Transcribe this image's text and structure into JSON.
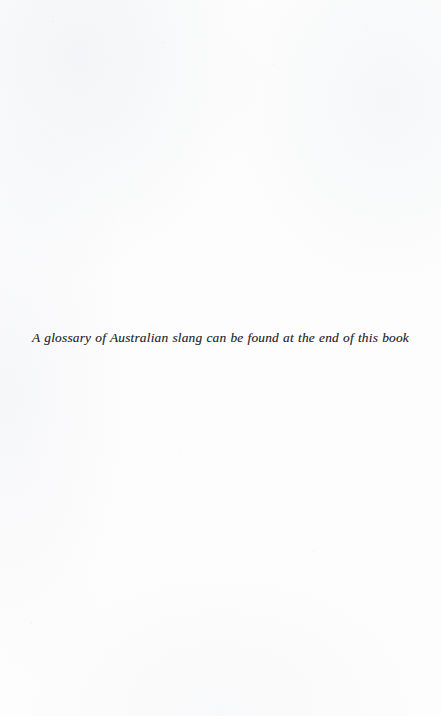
{
  "page": {
    "kind": "scanned-book-page",
    "background_color": "#fdfdfd",
    "width": 441,
    "height": 716
  },
  "note": {
    "text": "A glossary of Australian slang can be found at the end of this book",
    "style": "italic",
    "color": "#2b2b2e",
    "alignment": "center"
  }
}
